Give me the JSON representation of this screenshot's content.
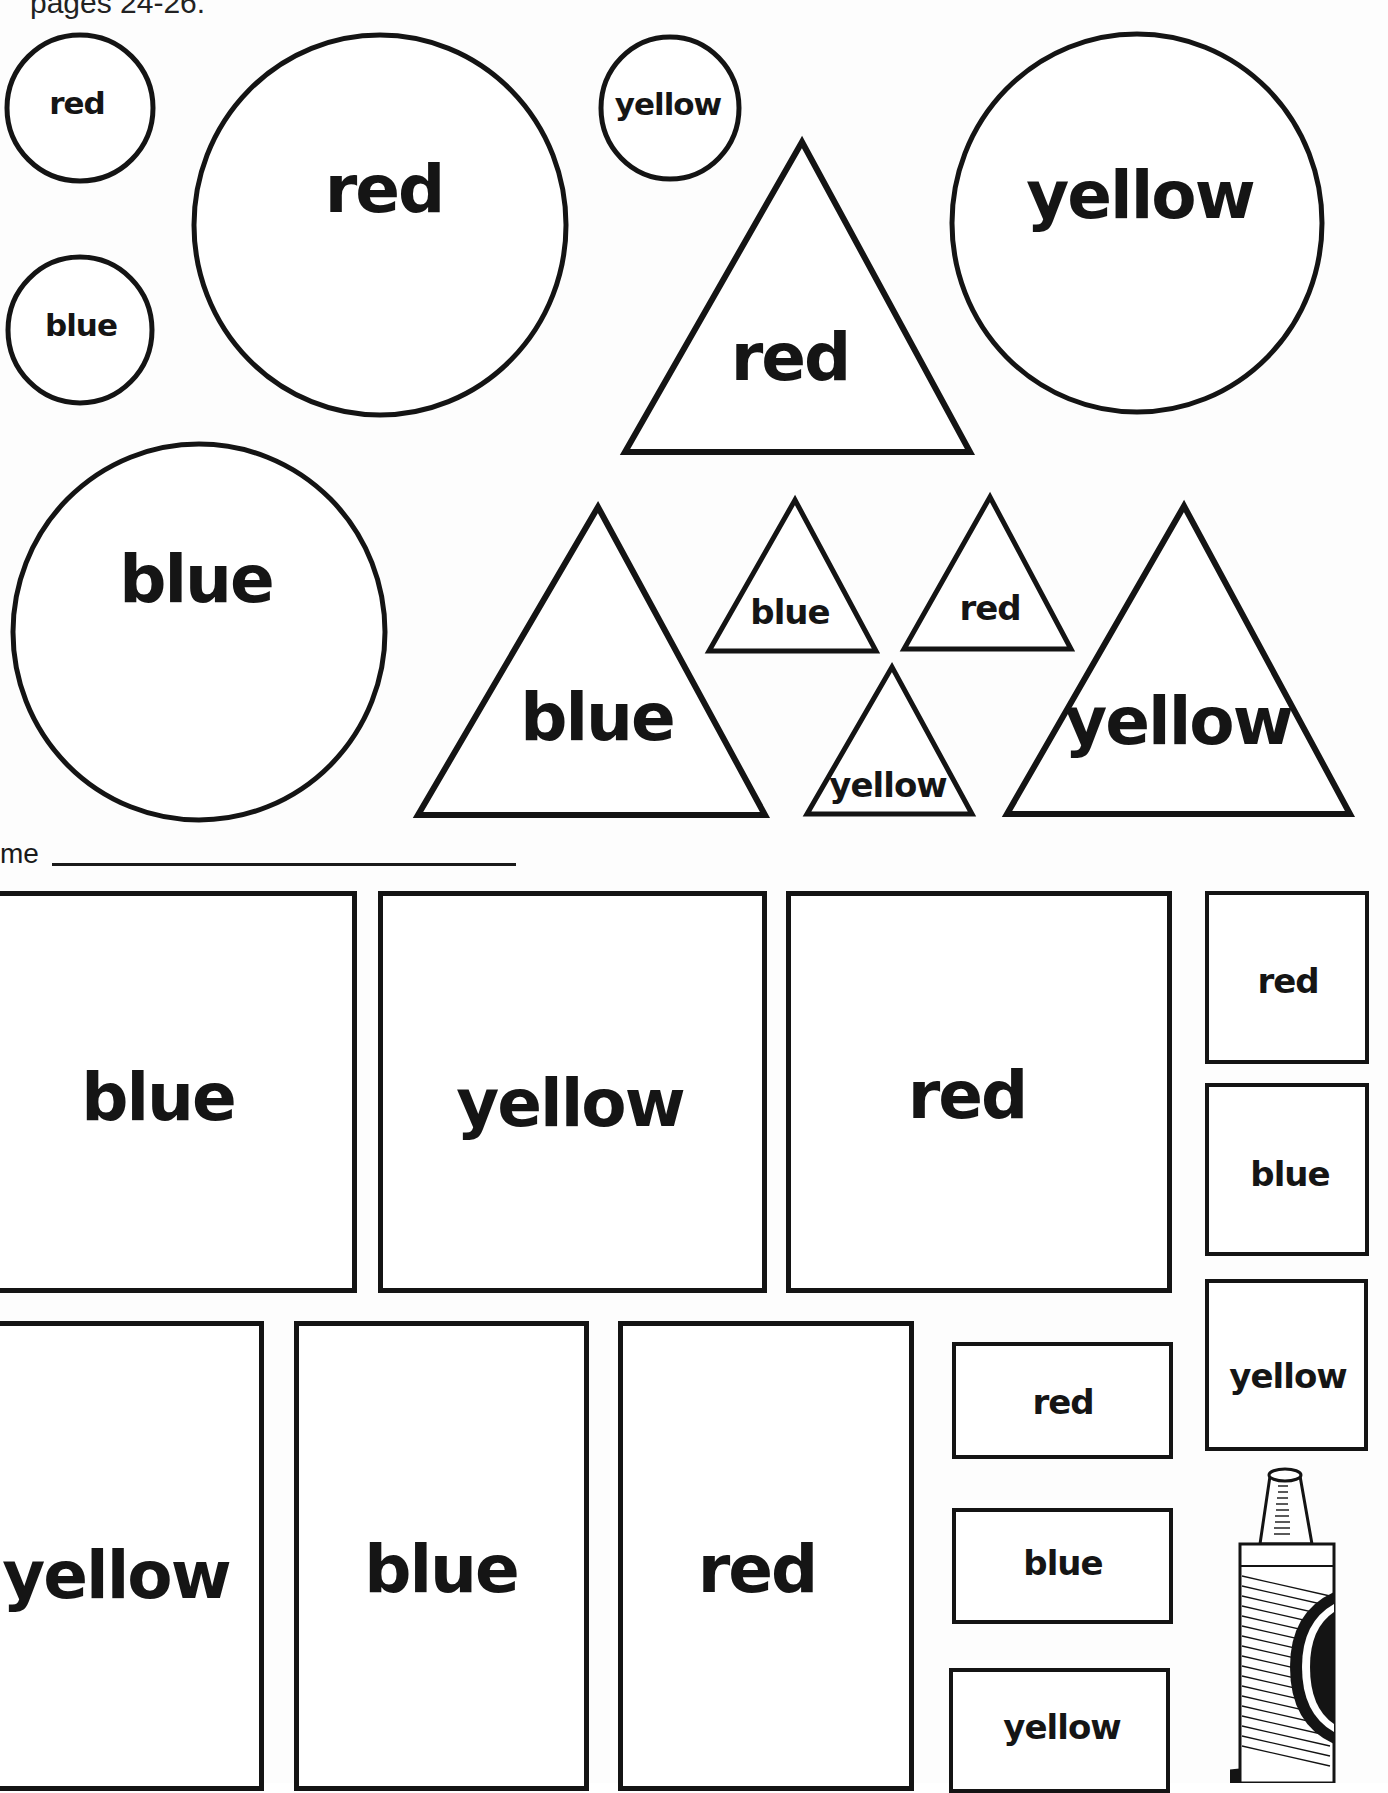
{
  "header": {
    "text": "pages 24-26."
  },
  "name_field": {
    "label": "me",
    "value": ""
  },
  "circles": [
    {
      "label": "red",
      "size": "small"
    },
    {
      "label": "blue",
      "size": "small"
    },
    {
      "label": "red",
      "size": "large"
    },
    {
      "label": "yellow",
      "size": "small"
    },
    {
      "label": "yellow",
      "size": "large"
    },
    {
      "label": "blue",
      "size": "large"
    }
  ],
  "triangles": [
    {
      "label": "red",
      "size": "large"
    },
    {
      "label": "blue",
      "size": "large"
    },
    {
      "label": "blue",
      "size": "small"
    },
    {
      "label": "red",
      "size": "small"
    },
    {
      "label": "yellow",
      "size": "small"
    },
    {
      "label": "yellow",
      "size": "large"
    }
  ],
  "rectangles": [
    {
      "label": "blue",
      "size": "large"
    },
    {
      "label": "yellow",
      "size": "large"
    },
    {
      "label": "red",
      "size": "large"
    },
    {
      "label": "red",
      "size": "small"
    },
    {
      "label": "blue",
      "size": "small"
    },
    {
      "label": "yellow",
      "size": "small"
    },
    {
      "label": "yellow",
      "size": "large"
    },
    {
      "label": "blue",
      "size": "large"
    },
    {
      "label": "red",
      "size": "large"
    },
    {
      "label": "red",
      "size": "small"
    },
    {
      "label": "blue",
      "size": "small"
    },
    {
      "label": "yellow",
      "size": "small"
    }
  ],
  "illustration": {
    "icon": "crayon-icon"
  },
  "colors": {
    "ink": "#141414",
    "paper": "#ffffff"
  }
}
